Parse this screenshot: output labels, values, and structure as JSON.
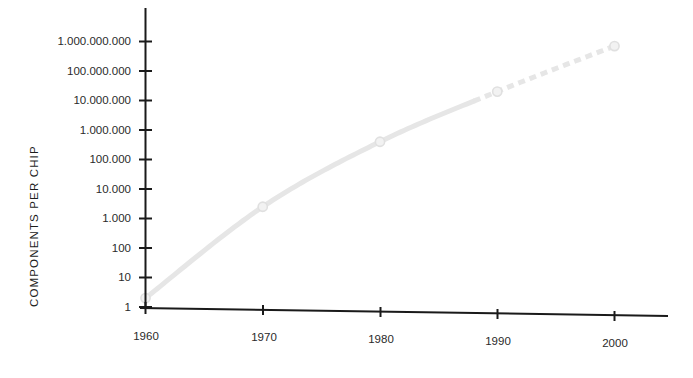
{
  "chart_data": {
    "type": "line",
    "title": "",
    "xlabel": "",
    "ylabel": "COMPONENTS PER CHIP",
    "yscale": "log",
    "ylim": [
      1,
      1000000000
    ],
    "xlim": [
      1960,
      2004
    ],
    "grid": false,
    "legend": null,
    "x": [
      1960,
      1970,
      1980,
      1990,
      2000
    ],
    "values": [
      2,
      2500,
      400000,
      20000000,
      700000000
    ],
    "series": [
      {
        "name": "Components per chip",
        "x": [
          1960,
          1970,
          1980,
          1990,
          2000
        ],
        "values": [
          2,
          2500,
          400000,
          20000000,
          700000000
        ],
        "color": "#e6e6e6",
        "marker": "circle",
        "solid_until": 1988,
        "dashed_from": 1988
      }
    ],
    "xticks": [
      1960,
      1970,
      1980,
      1990,
      2000
    ],
    "xtick_labels": [
      "1960",
      "1970",
      "1980",
      "1990",
      "2000"
    ],
    "yticks": [
      1,
      10,
      100,
      1000,
      10000,
      100000,
      1000000,
      10000000,
      100000000,
      1000000000
    ],
    "ytick_labels": [
      "1",
      "10",
      "100",
      "1.000",
      "10.000",
      "100.000",
      "1.000.000",
      "10.000.000",
      "100.000.000",
      "1.000.000.000"
    ],
    "axis_color": "#1a1a1a",
    "line_color": "#e6e6e6",
    "marker_color": "#e0e0e0",
    "background": "#ffffff"
  }
}
